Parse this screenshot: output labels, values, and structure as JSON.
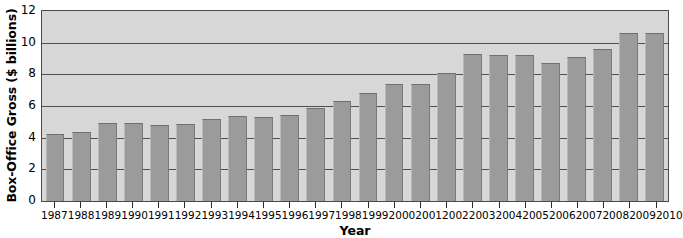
{
  "chart_data": {
    "type": "bar",
    "title": "",
    "xlabel": "Year",
    "ylabel": "Box-Office Gross ($ billions)",
    "categories": [
      "1987",
      "1988",
      "1989",
      "1990",
      "1991",
      "1992",
      "1993",
      "1994",
      "1995",
      "1996",
      "1997",
      "1998",
      "1999",
      "2000",
      "2001",
      "2002",
      "2003",
      "2004",
      "2005",
      "2006",
      "2007",
      "2008",
      "2009",
      "2010"
    ],
    "values": [
      4.25,
      4.35,
      4.9,
      4.9,
      4.8,
      4.85,
      5.15,
      5.35,
      5.3,
      5.45,
      5.9,
      6.3,
      6.8,
      7.4,
      7.4,
      8.1,
      9.3,
      9.2,
      9.2,
      8.7,
      9.1,
      9.6,
      10.6,
      10.6
    ],
    "ylim": [
      0,
      12
    ],
    "yticks": [
      0,
      2,
      4,
      6,
      8,
      10,
      12
    ],
    "ytick_labels": [
      "0",
      "2",
      "4",
      "6",
      "8",
      "10",
      "12"
    ],
    "grid": true,
    "grid_axis": "y",
    "legend": false,
    "legend_position": "none",
    "bar_color": "#9b9b9b",
    "plot_background": "#d7d7d7",
    "gridline_color": "#4f4f4f",
    "axis_color": "#4a4a4a",
    "figure_background": "#ffffff"
  }
}
